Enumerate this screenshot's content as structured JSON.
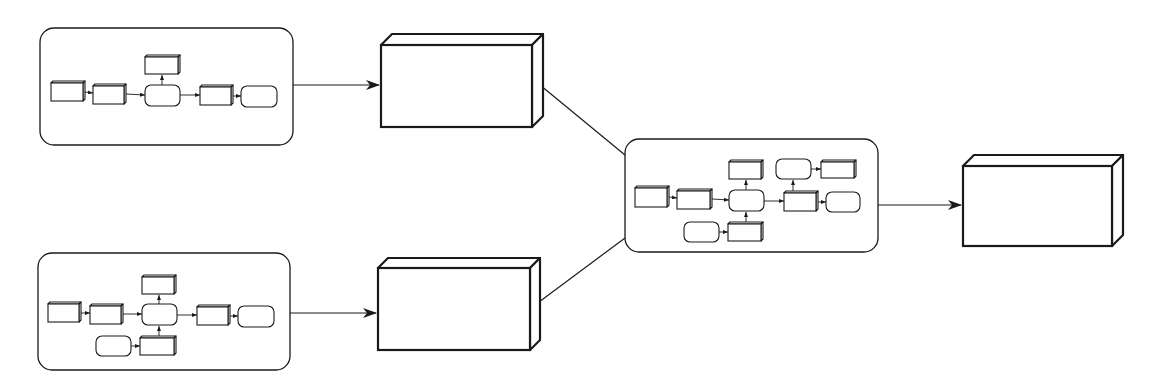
{
  "diagram": {
    "title": "",
    "colors": {
      "stroke": "#1a1a1a",
      "fill": "#ffffff",
      "background": "#ffffff"
    },
    "panels": [
      {
        "id": "panel-top-left",
        "x": 40,
        "y": 28,
        "w": 253,
        "h": 117,
        "r": 14,
        "nodes": [
          {
            "id": "a1",
            "type": "box",
            "x": 51,
            "y": 81,
            "w": 34,
            "h": 20
          },
          {
            "id": "a2",
            "type": "box",
            "x": 93,
            "y": 84,
            "w": 33,
            "h": 20
          },
          {
            "id": "a3",
            "type": "box",
            "x": 145,
            "y": 55,
            "w": 35,
            "h": 19
          },
          {
            "id": "a4",
            "type": "round",
            "x": 145,
            "y": 85,
            "w": 35,
            "h": 21
          },
          {
            "id": "a5",
            "type": "box",
            "x": 200,
            "y": 85,
            "w": 33,
            "h": 20
          },
          {
            "id": "a6",
            "type": "round",
            "x": 241,
            "y": 86,
            "w": 36,
            "h": 21
          }
        ],
        "edges": [
          {
            "from": [
              85,
              92
            ],
            "to": [
              93,
              93
            ]
          },
          {
            "from": [
              126,
              94
            ],
            "to": [
              145,
              95
            ]
          },
          {
            "from": [
              162,
              85
            ],
            "to": [
              162,
              75
            ]
          },
          {
            "from": [
              180,
              95
            ],
            "to": [
              200,
              95
            ]
          },
          {
            "from": [
              233,
              96
            ],
            "to": [
              241,
              96
            ]
          }
        ]
      },
      {
        "id": "panel-bottom-left",
        "x": 38,
        "y": 253,
        "w": 252,
        "h": 117,
        "r": 14,
        "nodes": [
          {
            "id": "b1",
            "type": "box",
            "x": 48,
            "y": 302,
            "w": 33,
            "h": 20
          },
          {
            "id": "b2",
            "type": "box",
            "x": 90,
            "y": 304,
            "w": 33,
            "h": 20
          },
          {
            "id": "b3",
            "type": "box",
            "x": 142,
            "y": 275,
            "w": 34,
            "h": 19
          },
          {
            "id": "b4",
            "type": "round",
            "x": 142,
            "y": 304,
            "w": 35,
            "h": 21
          },
          {
            "id": "b5",
            "type": "box",
            "x": 197,
            "y": 305,
            "w": 33,
            "h": 20
          },
          {
            "id": "b6",
            "type": "round",
            "x": 238,
            "y": 306,
            "w": 36,
            "h": 21
          },
          {
            "id": "b7",
            "type": "round",
            "x": 96,
            "y": 336,
            "w": 35,
            "h": 20
          },
          {
            "id": "b8",
            "type": "box",
            "x": 140,
            "y": 336,
            "w": 36,
            "h": 19
          }
        ],
        "edges": [
          {
            "from": [
              81,
              313
            ],
            "to": [
              90,
              313
            ]
          },
          {
            "from": [
              123,
              314
            ],
            "to": [
              142,
              314
            ]
          },
          {
            "from": [
              159,
              304
            ],
            "to": [
              159,
              295
            ]
          },
          {
            "from": [
              177,
              315
            ],
            "to": [
              197,
              315
            ]
          },
          {
            "from": [
              230,
              316
            ],
            "to": [
              238,
              316
            ]
          },
          {
            "from": [
              131,
              346
            ],
            "to": [
              140,
              346
            ]
          },
          {
            "from": [
              159,
              336
            ],
            "to": [
              159,
              326
            ]
          }
        ]
      },
      {
        "id": "panel-center",
        "x": 625,
        "y": 139,
        "w": 253,
        "h": 113,
        "r": 14,
        "nodes": [
          {
            "id": "c1",
            "type": "box",
            "x": 635,
            "y": 186,
            "w": 34,
            "h": 21
          },
          {
            "id": "c2",
            "type": "box",
            "x": 677,
            "y": 189,
            "w": 35,
            "h": 20
          },
          {
            "id": "c3",
            "type": "box",
            "x": 729,
            "y": 160,
            "w": 34,
            "h": 19
          },
          {
            "id": "c4",
            "type": "round",
            "x": 729,
            "y": 190,
            "w": 35,
            "h": 21
          },
          {
            "id": "c5",
            "type": "round",
            "x": 684,
            "y": 222,
            "w": 35,
            "h": 20
          },
          {
            "id": "c6",
            "type": "box",
            "x": 728,
            "y": 222,
            "w": 35,
            "h": 19
          },
          {
            "id": "c7",
            "type": "round",
            "x": 776,
            "y": 159,
            "w": 35,
            "h": 20
          },
          {
            "id": "c8",
            "type": "box",
            "x": 821,
            "y": 160,
            "w": 35,
            "h": 18
          },
          {
            "id": "c9",
            "type": "box",
            "x": 784,
            "y": 191,
            "w": 34,
            "h": 20
          },
          {
            "id": "c10",
            "type": "round",
            "x": 826,
            "y": 192,
            "w": 34,
            "h": 20
          }
        ],
        "edges": [
          {
            "from": [
              669,
              197
            ],
            "to": [
              677,
              198
            ]
          },
          {
            "from": [
              712,
              199
            ],
            "to": [
              729,
              200
            ]
          },
          {
            "from": [
              746,
              190
            ],
            "to": [
              746,
              180
            ]
          },
          {
            "from": [
              719,
              232
            ],
            "to": [
              728,
              232
            ]
          },
          {
            "from": [
              746,
              222
            ],
            "to": [
              746,
              212
            ]
          },
          {
            "from": [
              764,
              201
            ],
            "to": [
              784,
              201
            ]
          },
          {
            "from": [
              793,
              191
            ],
            "to": [
              793,
              180
            ]
          },
          {
            "from": [
              811,
              169
            ],
            "to": [
              821,
              169
            ]
          },
          {
            "from": [
              818,
              202
            ],
            "to": [
              826,
              202
            ]
          }
        ]
      }
    ],
    "blocks": [
      {
        "id": "block-top",
        "x": 381,
        "y": 45,
        "w": 151,
        "h": 82,
        "d": 11
      },
      {
        "id": "block-bottom",
        "x": 378,
        "y": 268,
        "w": 152,
        "h": 82,
        "d": 10
      },
      {
        "id": "block-output",
        "x": 963,
        "y": 166,
        "w": 149,
        "h": 80,
        "d": 11
      }
    ],
    "connectors": [
      {
        "id": "arrow-top-panel-to-block",
        "from": [
          293,
          85
        ],
        "to": [
          379,
          85
        ],
        "arrow": true
      },
      {
        "id": "arrow-bottom-panel-to-block",
        "from": [
          290,
          313
        ],
        "to": [
          376,
          313
        ],
        "arrow": true
      },
      {
        "id": "line-top-block-to-center",
        "from": [
          540,
          85
        ],
        "to": [
          625,
          155
        ],
        "arrow": false
      },
      {
        "id": "line-bottom-block-to-center",
        "from": [
          539,
          302
        ],
        "to": [
          625,
          238
        ],
        "arrow": false
      },
      {
        "id": "arrow-center-to-output",
        "from": [
          878,
          205
        ],
        "to": [
          961,
          205
        ],
        "arrow": true
      }
    ]
  }
}
